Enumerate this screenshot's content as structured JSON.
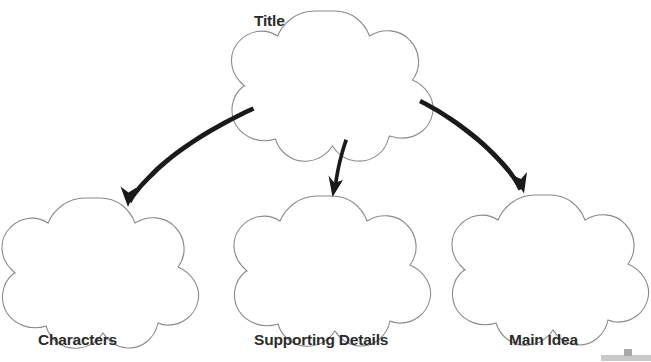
{
  "document": {
    "type": "graphic-organizer",
    "subtype": "story-map",
    "background_color": "#ffffff",
    "width": 651,
    "height": 362
  },
  "style": {
    "shape_outline_color": "#8a8a8a",
    "shape_fill_color": "#ffffff",
    "shape_outline_width": 1,
    "arrow_color": "#1a1a1a",
    "label_color": "#2b2b2b",
    "artifact_color": "#c9c9c9"
  },
  "nodes": [
    {
      "id": "title",
      "label": "Title",
      "shape": "five-lobed-flower",
      "label_position": "top-left",
      "cx": 335,
      "cy": 75,
      "rx": 88,
      "ry": 65
    },
    {
      "id": "characters",
      "label": "Characters",
      "shape": "five-lobed-flower",
      "label_position": "below",
      "cx": 100,
      "cy": 262,
      "rx": 88,
      "ry": 64
    },
    {
      "id": "supporting-details",
      "label": "Supporting Details",
      "shape": "five-lobed-flower",
      "label_position": "below",
      "cx": 332,
      "cy": 261,
      "rx": 88,
      "ry": 64
    },
    {
      "id": "main-idea",
      "label": "Main Idea",
      "shape": "five-lobed-flower",
      "label_position": "below",
      "cx": 550,
      "cy": 260,
      "rx": 88,
      "ry": 64
    }
  ],
  "connectors": [
    {
      "id": "arrow-title-to-characters",
      "from": "title",
      "to": "characters",
      "style": "curved-hand-drawn-arrow",
      "direction": "down-left"
    },
    {
      "id": "arrow-title-to-supporting-details",
      "from": "title",
      "to": "supporting-details",
      "style": "curved-hand-drawn-arrow",
      "direction": "down"
    },
    {
      "id": "arrow-title-to-main-idea",
      "from": "title",
      "to": "main-idea",
      "style": "curved-hand-drawn-arrow",
      "direction": "down-right"
    }
  ]
}
